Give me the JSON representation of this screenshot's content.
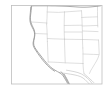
{
  "figure": {
    "title": "",
    "type": "map-thumbnail",
    "region": "Western United States",
    "background_color": "#ffffff",
    "frame_color": "#bdbdbd",
    "coastline_color": "#9a9a9a",
    "state_border_color": "#c8c8c8",
    "border_color": "#b0b0b0",
    "width_px": 107,
    "height_px": 91
  },
  "frame": {
    "x": 11,
    "y": 5,
    "width": 91,
    "height": 79,
    "stroke_width": 0.7
  },
  "map_layers": {
    "coastline_label": "Pacific coastline",
    "state_borders_label": "US state boundaries",
    "international_border_label": "US-Mexico border",
    "coastline_path": "M100.5,5.5 L97,6.5 L94,7 L91,8 L88,8.5 L85,8.8 L82,9 L79,9 L76,8.8 L73,8.5 L70,8.2 L67,8 L64,7.8 L61,7.6 L58,7.4 L55,7.2 L52,7 L49,6.8 L46,6.6 L43,6.4 L40,6.2 L37,6 L34,5.9 L31.5,5.8",
    "pacific_coast_path": "M31.6,6.0 C31.4,9.0 31.0,12.0 30.6,15.0 C30.2,18.0 30.4,20.5 31.0,22.5 C31.6,24.5 32.4,26.0 33.2,27.6 C34.0,29.2 34.6,30.8 34.8,32.6 C35.0,34.4 34.8,36.2 34.4,38.0 C34.0,39.8 33.6,41.4 33.6,43.0 C33.6,44.6 34.0,46.0 34.8,47.4 C35.8,49.2 37.0,50.8 38.2,52.4 C39.6,54.2 41.0,56.0 42.4,57.8 C43.8,59.6 45.2,61.4 46.6,63.0 C48.0,64.6 49.4,66.0 50.8,67.2 C52.2,68.4 53.6,69.4 55.0,70.2 C56.6,71.2 58.2,72.0 59.8,72.8",
    "baja_path": "M59.8,72.8 C60.8,73.4 61.8,74.2 62.6,75.2 C63.6,76.4 64.4,77.8 65.2,79.2 C66.0,80.6 66.8,82.0 67.6,83.4",
    "baja_inner_path": "M61.0,72.0 C62.2,73.4 63.4,74.8 64.4,76.4 C65.4,78.0 66.2,79.6 67.0,81.2 C67.6,82.4 68.2,83.2 68.8,83.9",
    "mexico_border_path": "M59.8,72.8 L63.5,73.2 L67.0,73.6 L70.5,74.2 L74.0,74.8 L77.5,75.6 L80.5,76.6 L83.0,78.0 L85.0,79.6 L86.6,81.2 L88.0,82.6 L89.2,83.8",
    "inner_border_path": "M66.0,70.0 L70.0,70.6 L74.0,71.4 L78.0,72.4 L81.5,73.8 L84.5,75.6 L87.0,77.6 L89.0,79.6 L90.6,81.4 L92.0,83.2",
    "state_paths": [
      "M47.5,5.5 L47.2,12.0 L47.0,18.5 L46.6,24.0",
      "M31.0,22.0 L38.0,22.4 L44.0,22.8 L47.1,23.0",
      "M46.6,24.0 L47.0,30.0 L47.2,36.0 L47.4,41.5",
      "M34.6,33.5 L40.0,33.7 L45.0,33.9 L47.2,34.0",
      "M47.3,38.5 L53.0,38.8 L59.0,39.0 L64.5,39.2",
      "M64.5,12.0 L64.3,18.0 L64.2,24.0 L64.2,30.0 L64.3,35.0 L64.5,39.2",
      "M47.2,12.0 L53.0,12.2 L58.5,12.4 L64.4,12.0",
      "M64.4,12.0 L70.0,11.6 L76.0,11.2 L81.5,10.8",
      "M81.5,10.8 L81.8,16.0 L82.0,21.0 L82.2,26.0 L82.4,31.0",
      "M64.3,25.5 L70.0,25.4 L76.0,25.3 L81.9,25.2",
      "M81.6,17.5 L87.0,17.2 L92.5,17.0 L97.5,16.8",
      "M97.5,6.0 L97.5,11.5 L97.5,16.8 L97.6,22.0 L97.8,27.0",
      "M82.2,26.0 L88.0,25.8 L93.0,25.6 L97.7,25.4",
      "M82.4,31.0 L88.0,31.2 L93.0,31.4 L98.0,31.6",
      "M64.4,32.0 L70.0,32.0 L76.0,32.0 L82.3,32.0",
      "M82.4,39.5 L88.0,39.6 L93.5,39.8 L98.5,40.0",
      "M82.3,32.0 L82.4,36.0 L82.5,39.6 L82.6,44.0 L82.8,48.0",
      "M64.5,39.2 L70.0,39.3 L76.0,39.4 L82.4,39.5",
      "M47.4,41.5 L47.6,47.0 L47.8,53.0 L48.0,58.0 L48.2,62.0",
      "M64.5,39.2 L64.6,45.0 L64.8,51.0 L65.0,57.0 L65.2,62.0",
      "M48.2,62.0 L54.0,62.2 L60.0,62.5 L65.2,62.8",
      "M65.2,62.8 L70.0,63.0 L75.0,63.2 L80.0,63.4 L83.0,63.5",
      "M82.8,48.0 L83.0,53.0 L83.0,58.0 L83.0,63.5",
      "M83.0,63.5 L83.2,67.0 L83.5,70.5 L84.0,73.5",
      "M98.5,40.0 L98.8,45.0 L99.0,50.0 L99.2,54.0",
      "M83.0,54.0 L88.0,54.2 L93.5,54.4 L98.9,54.6",
      "M99.0,55.0 L98.0,58.0 L96.5,61.0 L95.0,63.5 L93.5,66.0 L92.0,68.5 L90.5,71.0 L89.5,73.5"
    ]
  },
  "accessibility": {
    "alt_text": "Thumbnail outline map of the western United States with state boundaries"
  }
}
